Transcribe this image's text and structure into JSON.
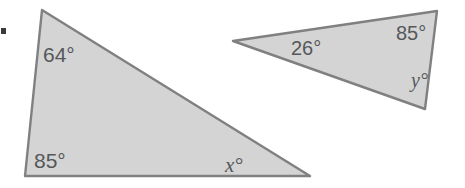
{
  "figure": {
    "background_color": "#ffffff",
    "fill_color": "#d4d4d4",
    "stroke_color": "#808080",
    "label_color": "#55585a",
    "marker_color": "#3a3a3a",
    "canvas": {
      "width": 465,
      "height": 188
    },
    "marker": {
      "name": "bullet-marker",
      "x": 1,
      "y": 28,
      "width": 5,
      "height": 6
    },
    "shapes": [
      {
        "id": "triangle-left",
        "name": "left-triangle",
        "points": "42,10 310,176 25,176",
        "vertices": [
          {
            "label": "apex",
            "x": 42,
            "y": 10
          },
          {
            "label": "bottom-right",
            "x": 310,
            "y": 176
          },
          {
            "label": "bottom-left",
            "x": 25,
            "y": 176
          }
        ],
        "angles": [
          {
            "id": "angle-64",
            "text": "64°",
            "value": 64,
            "unknown": false,
            "at_vertex": "apex"
          },
          {
            "id": "angle-85-left",
            "text": "85°",
            "value": 85,
            "unknown": false,
            "at_vertex": "bottom-left"
          },
          {
            "id": "angle-x",
            "text": "x°",
            "value": null,
            "unknown": true,
            "variable": "x",
            "at_vertex": "bottom-right"
          }
        ]
      },
      {
        "id": "triangle-right",
        "name": "right-triangle",
        "points": "233,41 437,11 425,109",
        "vertices": [
          {
            "label": "left-apex",
            "x": 233,
            "y": 41
          },
          {
            "label": "top-right",
            "x": 437,
            "y": 11
          },
          {
            "label": "bottom-right",
            "x": 425,
            "y": 109
          }
        ],
        "angles": [
          {
            "id": "angle-26",
            "text": "26°",
            "value": 26,
            "unknown": false,
            "at_vertex": "left-apex"
          },
          {
            "id": "angle-85-right",
            "text": "85°",
            "value": 85,
            "unknown": false,
            "at_vertex": "top-right"
          },
          {
            "id": "angle-y",
            "text": "y°",
            "value": null,
            "unknown": true,
            "variable": "y",
            "at_vertex": "bottom-right"
          }
        ]
      }
    ],
    "labels": {
      "left_top": "64°",
      "left_bottom": "85°",
      "left_unknown": "x°",
      "right_left": "26°",
      "right_top": "85°",
      "right_unknown": "y°"
    }
  }
}
